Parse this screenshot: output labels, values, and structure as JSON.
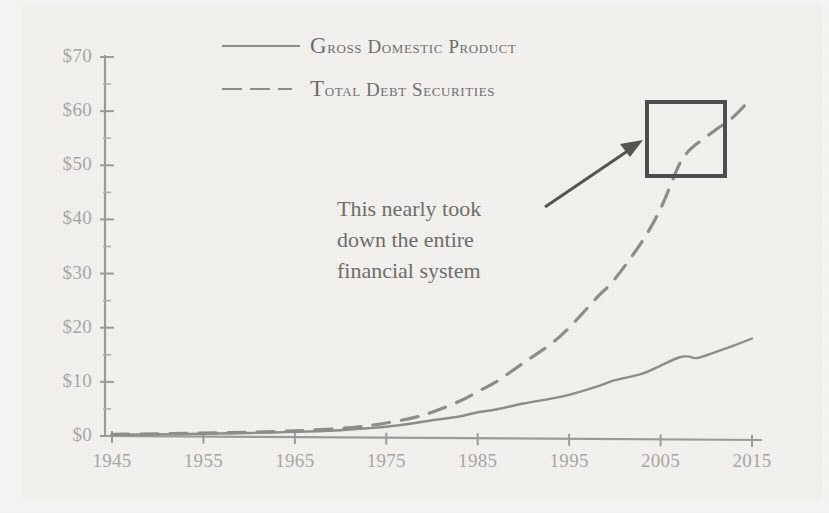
{
  "figure": {
    "background_color": "#f2f1ee",
    "ink_color": "#8d8c89",
    "label_color": "#a7a6a3",
    "box_color": "#4e4d4b"
  },
  "legend": {
    "position": "top-center",
    "items": [
      {
        "label": "Gross Domestic Product",
        "style": "solid",
        "icon": "solid-line-icon"
      },
      {
        "label": "Total Debt Securities",
        "style": "dashed",
        "icon": "dashed-line-icon"
      }
    ]
  },
  "annotation": {
    "icon": "arrow-icon",
    "lines": [
      "This nearly took",
      "down the entire",
      "financial system"
    ],
    "highlight_label": "2007-2009 crisis highlight box"
  },
  "axes": {
    "y_ticks": [
      "$0",
      "$10",
      "$20",
      "$30",
      "$40",
      "$50",
      "$60",
      "$70"
    ],
    "x_ticks": [
      "1945",
      "1955",
      "1965",
      "1975",
      "1985",
      "1995",
      "2005",
      "2015"
    ]
  },
  "chart_data": {
    "type": "line",
    "title": "",
    "subtitle": "",
    "xlabel": "",
    "ylabel": "",
    "xlim": [
      1945,
      2015
    ],
    "ylim": [
      0,
      70
    ],
    "y_unit": "trillions of US dollars",
    "y_tick_values": [
      0,
      10,
      20,
      30,
      40,
      50,
      60,
      70
    ],
    "y_tick_labels": [
      "$0",
      "$10",
      "$20",
      "$30",
      "$40",
      "$50",
      "$60",
      "$70"
    ],
    "y_minor_tick_step": 5,
    "x_tick_values": [
      1945,
      1955,
      1965,
      1975,
      1985,
      1995,
      2005,
      2015
    ],
    "x_tick_labels": [
      "1945",
      "1955",
      "1965",
      "1975",
      "1985",
      "1995",
      "2005",
      "2015"
    ],
    "grid": false,
    "legend_position": "top-center",
    "x": [
      1945,
      1950,
      1955,
      1960,
      1965,
      1970,
      1973,
      1975,
      1978,
      1980,
      1983,
      1985,
      1987,
      1990,
      1993,
      1995,
      1998,
      2000,
      2003,
      2005,
      2007,
      2008,
      2009,
      2011,
      2013,
      2015
    ],
    "series": [
      {
        "name": "Gross Domestic Product",
        "style": "solid",
        "color": "#8d8c89",
        "values": [
          0.23,
          0.3,
          0.43,
          0.55,
          0.75,
          1.08,
          1.43,
          1.7,
          2.35,
          2.9,
          3.6,
          4.4,
          4.9,
          6.0,
          6.9,
          7.6,
          9.1,
          10.3,
          11.5,
          13.0,
          14.5,
          14.7,
          14.4,
          15.5,
          16.7,
          18.0
        ]
      },
      {
        "name": "Total Debt Securities",
        "style": "dashed",
        "color": "#8d8c89",
        "values": [
          0.3,
          0.4,
          0.55,
          0.7,
          0.95,
          1.4,
          1.9,
          2.4,
          3.4,
          4.4,
          6.4,
          8.2,
          10.0,
          13.5,
          17.0,
          20.0,
          25.5,
          29.0,
          36.0,
          42.0,
          50.0,
          52.5,
          54.0,
          56.5,
          59.0,
          62.5
        ]
      }
    ],
    "annotations": [
      {
        "text": "This nearly took down the entire financial system",
        "points_to": {
          "x": 2007,
          "y": 54
        },
        "highlight_box": {
          "x_range": [
            2003,
            2012
          ],
          "y_range": [
            48,
            63
          ]
        }
      }
    ]
  }
}
